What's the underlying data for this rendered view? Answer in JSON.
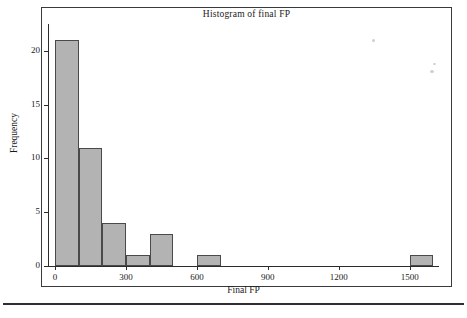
{
  "chart_data": {
    "type": "bar",
    "title": "Histogram of final FP",
    "xlabel": "Final FP",
    "ylabel": "Frequency",
    "xlim": [
      -30,
      1620
    ],
    "ylim": [
      0,
      22.5
    ],
    "grid": false,
    "legend": null,
    "bin_width": 100,
    "bins": [
      {
        "start": 0,
        "end": 100,
        "value": 21
      },
      {
        "start": 100,
        "end": 200,
        "value": 11
      },
      {
        "start": 200,
        "end": 300,
        "value": 4
      },
      {
        "start": 300,
        "end": 400,
        "value": 1
      },
      {
        "start": 400,
        "end": 500,
        "value": 3
      },
      {
        "start": 500,
        "end": 600,
        "value": 0
      },
      {
        "start": 600,
        "end": 700,
        "value": 1
      },
      {
        "start": 700,
        "end": 800,
        "value": 0
      },
      {
        "start": 800,
        "end": 900,
        "value": 0
      },
      {
        "start": 900,
        "end": 1000,
        "value": 0
      },
      {
        "start": 1000,
        "end": 1100,
        "value": 0
      },
      {
        "start": 1100,
        "end": 1200,
        "value": 0
      },
      {
        "start": 1200,
        "end": 1300,
        "value": 0
      },
      {
        "start": 1300,
        "end": 1400,
        "value": 0
      },
      {
        "start": 1400,
        "end": 1500,
        "value": 0
      },
      {
        "start": 1500,
        "end": 1600,
        "value": 1
      }
    ],
    "categories": [
      "0-100",
      "100-200",
      "200-300",
      "300-400",
      "400-500",
      "500-600",
      "600-700",
      "700-800",
      "800-900",
      "900-1000",
      "1000-1100",
      "1100-1200",
      "1200-1300",
      "1300-1400",
      "1400-1500",
      "1500-1600"
    ],
    "values": [
      21,
      11,
      4,
      1,
      3,
      0,
      1,
      0,
      0,
      0,
      0,
      0,
      0,
      0,
      0,
      1
    ],
    "xticks": [
      0,
      300,
      600,
      900,
      1200,
      1500
    ],
    "xtick_labels": [
      "0",
      "300",
      "600",
      "900",
      "1200",
      "1500"
    ],
    "yticks": [
      0,
      5,
      10,
      15,
      20
    ],
    "ytick_labels": [
      "0",
      "5",
      "10",
      "15",
      "20"
    ],
    "bar_color": "#b3b3b3",
    "bar_edge_color": "#4a4a4a",
    "axis_color": "#2b2b2b"
  }
}
